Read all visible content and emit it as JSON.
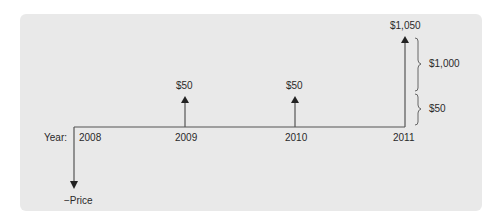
{
  "diagram": {
    "year_label": "Year:",
    "years": [
      "2008",
      "2009",
      "2010",
      "2011"
    ],
    "flows": [
      {
        "year": "2008",
        "label": "−Price",
        "direction": "down"
      },
      {
        "year": "2009",
        "label": "$50",
        "direction": "up"
      },
      {
        "year": "2010",
        "label": "$50",
        "direction": "up"
      },
      {
        "year": "2011",
        "label": "$1,050",
        "direction": "up"
      }
    ],
    "brackets": [
      {
        "label": "$1,000"
      },
      {
        "label": "$50"
      }
    ],
    "colors": {
      "panel": "#e9e9e9",
      "line": "#555555",
      "arrowhead": "#222222",
      "text": "#2a2a2a"
    }
  }
}
